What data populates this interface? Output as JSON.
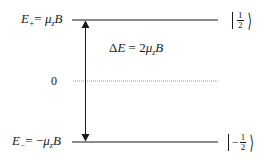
{
  "diagram": {
    "type": "energy-level-diagram",
    "levels": [
      {
        "id": "upper",
        "label_symbol": "E",
        "label_subscript": "+",
        "label_rhs_prefix": "= ",
        "label_rhs_mu": "μ",
        "label_rhs_mu_sub": "z",
        "label_rhs_field": "B",
        "ket_sign": "",
        "ket_num": "1",
        "ket_den": "2"
      },
      {
        "id": "lower",
        "label_symbol": "E",
        "label_subscript": "−",
        "label_rhs_prefix": "= −",
        "label_rhs_mu": "μ",
        "label_rhs_mu_sub": "z",
        "label_rhs_field": "B",
        "ket_sign": "−",
        "ket_num": "1",
        "ket_den": "2"
      }
    ],
    "zero_label": "0",
    "gap_label": {
      "delta": "Δ",
      "symbol": "E",
      "equals": " = 2",
      "mu": "μ",
      "mu_sub": "z",
      "field": "B"
    },
    "colors": {
      "ink": "#1a1a1a",
      "dotted_line": "#8a8a8a",
      "background": "#ffffff"
    }
  }
}
